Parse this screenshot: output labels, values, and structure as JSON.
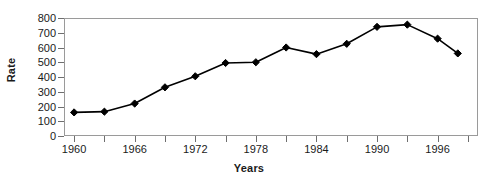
{
  "chart_data": {
    "type": "line",
    "title": "",
    "xlabel": "Years",
    "ylabel": "Rate",
    "x": [
      1960,
      1963,
      1966,
      1969,
      1972,
      1975,
      1978,
      1981,
      1984,
      1987,
      1990,
      1993,
      1996,
      1998
    ],
    "values": [
      160,
      165,
      220,
      330,
      405,
      495,
      500,
      600,
      555,
      625,
      740,
      755,
      660,
      560
    ],
    "series": [
      {
        "name": "Rate",
        "values": [
          160,
          165,
          220,
          330,
          405,
          495,
          500,
          600,
          555,
          625,
          740,
          755,
          660,
          560
        ]
      }
    ],
    "xlim": [
      1959,
      2000
    ],
    "ylim": [
      0,
      800
    ],
    "y_ticks": [
      0,
      100,
      200,
      300,
      400,
      500,
      600,
      700,
      800
    ],
    "y_tick_labels": [
      "0",
      "100",
      "200",
      "300",
      "400",
      "500",
      "600",
      "700",
      "800"
    ],
    "x_ticks": [
      1960,
      1963,
      1966,
      1969,
      1972,
      1975,
      1978,
      1981,
      1984,
      1987,
      1990,
      1993,
      1996,
      1999
    ],
    "x_tick_labels": [
      "1960",
      "",
      "1966",
      "",
      "1972",
      "",
      "1978",
      "",
      "1984",
      "",
      "1990",
      "",
      "1996",
      ""
    ],
    "x_labeled_ticks": [
      {
        "year": 1960,
        "label": "1960"
      },
      {
        "year": 1966,
        "label": "1966"
      },
      {
        "year": 1972,
        "label": "1972"
      },
      {
        "year": 1978,
        "label": "1978"
      },
      {
        "year": 1984,
        "label": "1984"
      },
      {
        "year": 1990,
        "label": "1990"
      },
      {
        "year": 1996,
        "label": "1996"
      }
    ],
    "grid": false,
    "legend": "none",
    "marker": "diamond",
    "line_color": "#000000",
    "marker_color": "#000000",
    "frame_color": "#9a9a9a",
    "background": "#ffffff"
  }
}
